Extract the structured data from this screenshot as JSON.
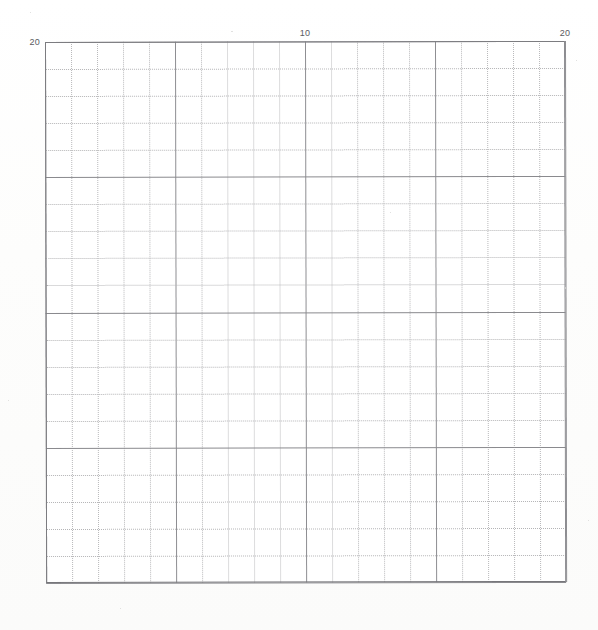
{
  "figure": {
    "kind": "graph-paper-grid",
    "background_color": "#fefefe",
    "grid_major_color": "#8a8a8e",
    "grid_minor_color": "#b9b9bb",
    "frame_color": "#7c7c80",
    "label_color": "#5a5a5e"
  },
  "chart_data": {
    "type": "scatter",
    "title": "",
    "subtitle": "",
    "xlabel": "",
    "ylabel": "",
    "xlim": [
      0,
      20
    ],
    "ylim": [
      20,
      0
    ],
    "x_axis_position": "top",
    "y_axis_position": "left",
    "y_inverted": true,
    "grid": true,
    "grid_major_step": 5,
    "grid_minor_step": 1,
    "legend": null,
    "legend_position": "none",
    "x_tick_labels": [
      "10",
      "20"
    ],
    "x_tick_values": [
      10,
      20
    ],
    "y_tick_labels": [
      "5",
      "10",
      "15",
      "20"
    ],
    "y_tick_values": [
      5,
      10,
      15,
      20
    ],
    "series": [],
    "annotations": [],
    "values": [],
    "categories": []
  },
  "axes": {
    "top": {
      "name": "top-axis",
      "ticks": [
        {
          "value": 10,
          "label": "10"
        },
        {
          "value": 20,
          "label": "20"
        }
      ]
    },
    "left": {
      "name": "left-axis",
      "ticks": [
        {
          "value": 5,
          "label": "5"
        },
        {
          "value": 10,
          "label": "10"
        },
        {
          "value": 15,
          "label": "15"
        },
        {
          "value": 20,
          "label": "20"
        }
      ]
    }
  }
}
